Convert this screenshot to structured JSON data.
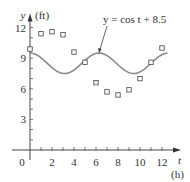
{
  "chart_data": {
    "type": "scatter",
    "title": "",
    "xlabel": "t",
    "xunit": "(h)",
    "ylabel": "y",
    "yunit": "(ft)",
    "xlim": [
      0,
      13
    ],
    "ylim": [
      0,
      12.5
    ],
    "x_ticks": [
      2,
      4,
      6,
      8,
      10,
      12
    ],
    "y_ticks": [
      3,
      6,
      9,
      12
    ],
    "origin_label": "0",
    "grid": false,
    "series": [
      {
        "name": "data",
        "type": "scatter",
        "marker": "open-square",
        "x": [
          0,
          1,
          2,
          3,
          4,
          5,
          6,
          7,
          8,
          9,
          10,
          11,
          12
        ],
        "y": [
          9.9,
          11.4,
          11.6,
          11.3,
          9.6,
          8.6,
          6.6,
          5.7,
          5.4,
          5.9,
          7.0,
          8.6,
          10.0
        ]
      },
      {
        "name": "y = cos t + 8.5",
        "type": "line",
        "expression": "cos(t) + 8.5",
        "t_range": [
          0,
          12.5
        ],
        "color": "#8a8a8a"
      }
    ],
    "annotations": [
      {
        "text": "y =  cos t + 8.5",
        "points_to": [
          6.28,
          9.5
        ]
      }
    ]
  },
  "layout": {
    "origin_px": [
      30,
      150
    ],
    "px_per_x": 11,
    "px_per_y": 10.2
  }
}
